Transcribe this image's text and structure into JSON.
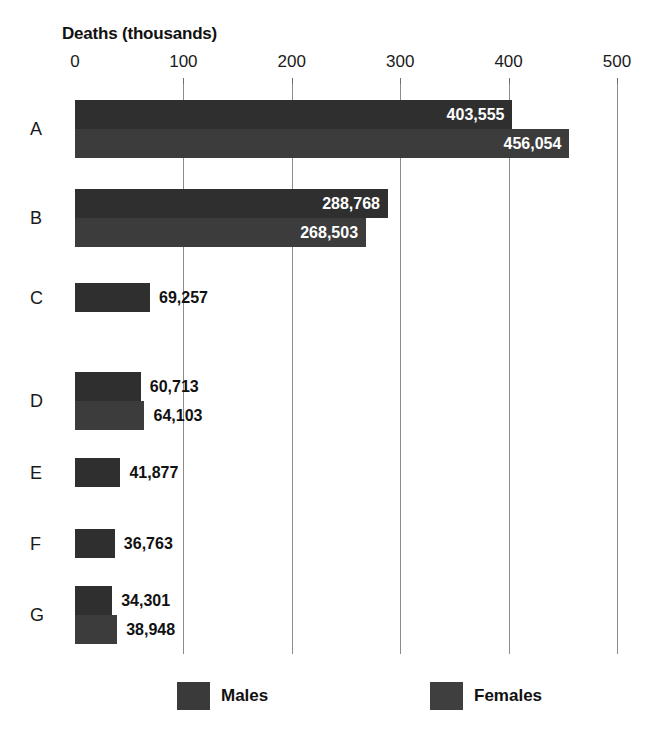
{
  "chart_data": {
    "type": "bar",
    "orientation": "horizontal",
    "title": "Deaths (thousands)",
    "xlabel": "Deaths (thousands)",
    "ylabel": "",
    "xlim": [
      0,
      500
    ],
    "xticks": [
      0,
      100,
      200,
      300,
      400,
      500
    ],
    "xtick_labels": [
      "0",
      "100",
      "200",
      "300",
      "400",
      "500"
    ],
    "grid": true,
    "legend_position": "bottom",
    "categories": [
      "A",
      "B",
      "C",
      "D",
      "E",
      "F",
      "G"
    ],
    "series": [
      {
        "name": "Males",
        "color": "#2f2f2f",
        "values": [
          403555,
          288768,
          69257,
          60713,
          41877,
          36763,
          34301
        ],
        "value_labels": [
          "403,555",
          "288,768",
          "69,257",
          "60,713",
          "41,877",
          "36,763",
          "34,301"
        ]
      },
      {
        "name": "Females",
        "color": "#3c3c3c",
        "values": [
          456054,
          268503,
          null,
          64103,
          null,
          null,
          38948
        ],
        "value_labels": [
          "456,054",
          "268,503",
          null,
          "64,103",
          null,
          null,
          "38,948"
        ]
      }
    ]
  },
  "legend": {
    "items": [
      {
        "label": "Males",
        "swatch": "#3a3a3a"
      },
      {
        "label": "Females",
        "swatch": "#3f3f3f"
      }
    ]
  }
}
